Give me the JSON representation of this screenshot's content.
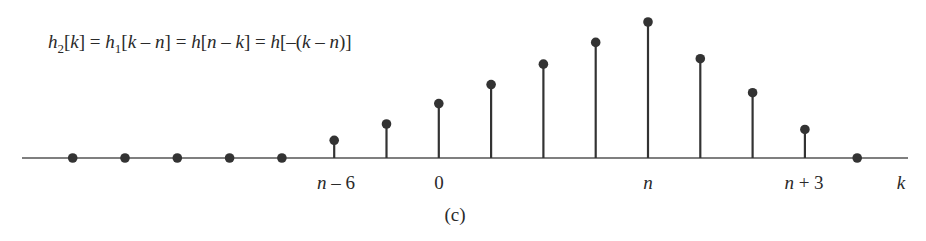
{
  "figure": {
    "equation": "h₂[k] = h₁[k − n] = h[n − k] = h[−(k − n)]",
    "caption": "(c)",
    "axis_label": "k",
    "tick_labels": [
      {
        "text": "n − 6",
        "x": 336
      },
      {
        "text": "0",
        "x": 439
      },
      {
        "text": "n",
        "x": 648
      },
      {
        "text": "n + 3",
        "x": 804
      }
    ],
    "colors": {
      "stem": "#333333",
      "axis": "#555555",
      "text": "#2a2a2a"
    }
  },
  "chart_data": {
    "type": "stem",
    "xlabel": "k",
    "ylabel": "",
    "caption": "(c)",
    "x_relative_to_n": [
      -11,
      -10,
      -9,
      -8,
      -7,
      -6,
      -5,
      -4,
      -3,
      -2,
      -1,
      0,
      1,
      2,
      3,
      4
    ],
    "values": [
      0,
      0,
      0,
      0,
      0,
      0.13,
      0.25,
      0.4,
      0.54,
      0.69,
      0.85,
      1.0,
      0.73,
      0.48,
      0.21,
      0
    ],
    "tick_labels": [
      "n - 6",
      "0",
      "n",
      "n + 3"
    ]
  }
}
